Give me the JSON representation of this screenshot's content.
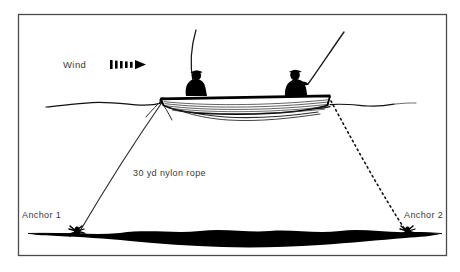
{
  "figure": {
    "background_color": "#ffffff",
    "ink_color": "#000000",
    "text_color": "#3a3a3a",
    "border": {
      "present": true,
      "color": "#4a4a4a",
      "inset_left": 18,
      "inset_top": 14,
      "inset_right": 447,
      "inset_bottom": 256
    },
    "labels": {
      "wind": "Wind",
      "rope": "30 yd nylon rope",
      "anchor_1": "Anchor 1",
      "anchor_2": "Anchor 2"
    },
    "icons": {
      "wind_arrow": "wind-arrow-icon",
      "anchor_1_symbol": "anchor-icon",
      "anchor_2_symbol": "anchor-icon"
    },
    "elements": {
      "boat": "rowboat-silhouette",
      "anglers": [
        "angler-bow-silhouette",
        "angler-stern-silhouette"
      ],
      "rods": [
        "fishing-rod-left",
        "fishing-rod-right"
      ],
      "water_surface": "waterline",
      "lake_bottom": "lake-bottom-silhouette",
      "bow_rope_style": "solid",
      "stern_rope_style": "dashed"
    },
    "geometry": {
      "waterline_y": 103,
      "boat_bow_x": 162,
      "boat_stern_x": 330,
      "anchor_1_point": [
        78,
        233
      ],
      "anchor_2_point": [
        408,
        233
      ],
      "rope_length_yards": 30
    }
  }
}
